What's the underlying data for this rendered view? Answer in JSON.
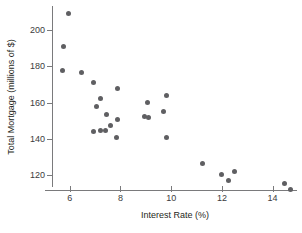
{
  "chart_data": {
    "type": "scatter",
    "title": "",
    "xlabel": "Interest Rate (%)",
    "ylabel": "Total Mortgage (millions of $)",
    "xlim": [
      5.3,
      15.0
    ],
    "ylim": [
      112,
      212
    ],
    "xticks": [
      6,
      8,
      10,
      12,
      14
    ],
    "yticks": [
      120,
      140,
      160,
      180,
      200
    ],
    "xtick_labels": [
      "6",
      "8",
      "10",
      "12",
      "14"
    ],
    "ytick_labels": [
      "120",
      "140",
      "160",
      "180",
      "200"
    ],
    "grid": false,
    "legend": false,
    "marker_color": "#5f5f62",
    "axis_color": "#7a7a7c",
    "background": "#ffffff",
    "points": [
      {
        "x": 5.95,
        "y": 209.0
      },
      {
        "x": 5.75,
        "y": 191.0
      },
      {
        "x": 5.7,
        "y": 177.5
      },
      {
        "x": 6.45,
        "y": 176.5
      },
      {
        "x": 6.95,
        "y": 170.8
      },
      {
        "x": 7.2,
        "y": 162.5
      },
      {
        "x": 7.05,
        "y": 157.8
      },
      {
        "x": 7.9,
        "y": 167.5
      },
      {
        "x": 7.45,
        "y": 153.5
      },
      {
        "x": 7.9,
        "y": 151.0
      },
      {
        "x": 7.6,
        "y": 147.5
      },
      {
        "x": 6.95,
        "y": 144.3
      },
      {
        "x": 7.2,
        "y": 144.8
      },
      {
        "x": 7.4,
        "y": 144.5
      },
      {
        "x": 7.85,
        "y": 141.0
      },
      {
        "x": 9.05,
        "y": 160.3
      },
      {
        "x": 8.95,
        "y": 152.5
      },
      {
        "x": 9.1,
        "y": 152.0
      },
      {
        "x": 9.8,
        "y": 163.8
      },
      {
        "x": 9.7,
        "y": 155.0
      },
      {
        "x": 9.8,
        "y": 140.8
      },
      {
        "x": 11.25,
        "y": 126.5
      },
      {
        "x": 12.0,
        "y": 120.5
      },
      {
        "x": 12.25,
        "y": 117.3
      },
      {
        "x": 12.5,
        "y": 122.0
      },
      {
        "x": 14.45,
        "y": 115.3
      },
      {
        "x": 14.7,
        "y": 112.5
      }
    ]
  }
}
